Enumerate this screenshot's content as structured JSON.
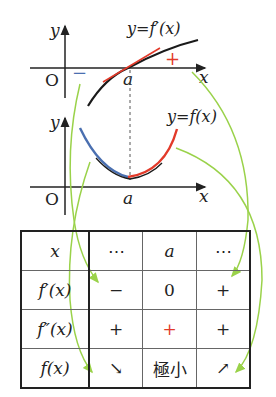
{
  "top_caption_partial": "y′(x) … f′(x) …",
  "upper_graph": {
    "y_axis_label": "y",
    "x_axis_label": "x",
    "origin_label": "O",
    "point_label": "a",
    "curve_label": "y=f′(x)",
    "minus_sign": "−",
    "plus_sign": "+"
  },
  "lower_graph": {
    "y_axis_label": "y",
    "x_axis_label": "x",
    "origin_label": "O",
    "point_label": "a",
    "curve_label": "y=f(x)"
  },
  "table": {
    "rows": [
      {
        "header": "x",
        "cells": [
          "⋯",
          "a",
          "⋯"
        ]
      },
      {
        "header": "f′(x)",
        "cells": [
          "−",
          "0",
          "+"
        ]
      },
      {
        "header": "f″(x)",
        "cells": [
          "+",
          "+",
          "+"
        ]
      },
      {
        "header": "f(x)",
        "cells": [
          "↘",
          "極小",
          "↗"
        ]
      }
    ]
  },
  "colors": {
    "axis": "#222222",
    "derivative_curve": "#1a1a1a",
    "tangent_red": "#e23a2a",
    "decreasing_blue": "#4a6fb0",
    "arrow_green": "#9ad24a"
  }
}
